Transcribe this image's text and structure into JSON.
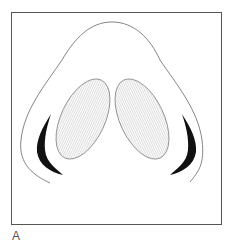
{
  "figure": {
    "panel_label": "A",
    "colors": {
      "frame": "#555555",
      "outline": "#666666",
      "fill_dark": "#111111",
      "hatch": "#bbbbbb"
    }
  }
}
